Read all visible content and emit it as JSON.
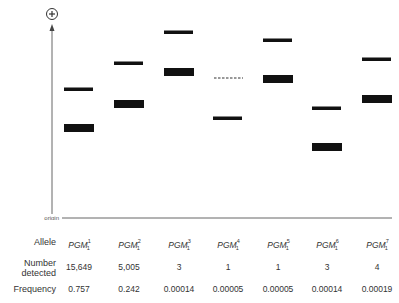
{
  "diagram": {
    "axis": {
      "pole_symbol": "+",
      "origin_label": "origin"
    },
    "lanes": [
      {
        "allele": "PGM",
        "superscript": "1",
        "subscript": "1",
        "x": 64,
        "thin_y": 89,
        "thick_y": 124,
        "dashed_y": null
      },
      {
        "allele": "PGM",
        "superscript": "2",
        "subscript": "1",
        "x": 114,
        "thin_y": 63,
        "thick_y": 100,
        "dashed_y": null
      },
      {
        "allele": "PGM",
        "superscript": "3",
        "subscript": "1",
        "x": 164,
        "thin_y": 32,
        "thick_y": 68,
        "dashed_y": null
      },
      {
        "allele": "PGM",
        "superscript": "4",
        "subscript": "1",
        "x": 213,
        "thin_y": 118,
        "thick_y": null,
        "dashed_y": 78
      },
      {
        "allele": "PGM",
        "superscript": "5",
        "subscript": "1",
        "x": 263,
        "thin_y": 40,
        "thick_y": 75,
        "dashed_y": null
      },
      {
        "allele": "PGM",
        "superscript": "6",
        "subscript": "1",
        "x": 312,
        "thin_y": 108,
        "thick_y": 143,
        "dashed_y": null
      },
      {
        "allele": "PGM",
        "superscript": "7",
        "subscript": "1",
        "x": 362,
        "thin_y": 59,
        "thick_y": 95,
        "dashed_y": null
      }
    ]
  },
  "table": {
    "row_labels": {
      "allele": "Allele",
      "number_line1": "Number",
      "number_line2": "detected",
      "frequency": "Frequency"
    },
    "columns": [
      {
        "allele": "PGM",
        "sup": "1",
        "sub": "1",
        "number": "15,649",
        "frequency": "0.757"
      },
      {
        "allele": "PGM",
        "sup": "2",
        "sub": "1",
        "number": "5,005",
        "frequency": "0.242"
      },
      {
        "allele": "PGM",
        "sup": "3",
        "sub": "1",
        "number": "3",
        "frequency": "0.00014"
      },
      {
        "allele": "PGM",
        "sup": "4",
        "sub": "1",
        "number": "1",
        "frequency": "0.00005"
      },
      {
        "allele": "PGM",
        "sup": "5",
        "sub": "1",
        "number": "1",
        "frequency": "0.00005"
      },
      {
        "allele": "PGM",
        "sup": "6",
        "sub": "1",
        "number": "3",
        "frequency": "0.00014"
      },
      {
        "allele": "PGM",
        "sup": "7",
        "sub": "1",
        "number": "4",
        "frequency": "0.00019"
      }
    ]
  },
  "colors": {
    "band": "#111111",
    "axis": "#555555",
    "text": "#333333"
  }
}
